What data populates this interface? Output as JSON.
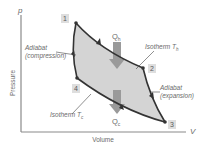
{
  "diagram": {
    "axes": {
      "y_symbol": "p",
      "y_label": "Pressure",
      "x_symbol": "V",
      "x_label": "Volume"
    },
    "points": [
      {
        "id": "1",
        "label": "1"
      },
      {
        "id": "2",
        "label": "2"
      },
      {
        "id": "3",
        "label": "3"
      },
      {
        "id": "4",
        "label": "4"
      }
    ],
    "heat": {
      "in": {
        "label": "Q",
        "sub": "h"
      },
      "out": {
        "label": "Q",
        "sub": "c"
      }
    },
    "annotations": {
      "adiabat_compression": {
        "line1": "Adiabat",
        "line2": "(compression)"
      },
      "adiabat_expansion": {
        "line1": "Adiabat",
        "line2": "(expansion)"
      },
      "isotherm_hot": {
        "text": "Isotherm T",
        "sub": "h"
      },
      "isotherm_cold": {
        "text": "Isotherm T",
        "sub": "c"
      }
    },
    "colors": {
      "fill": "#d4d4d4",
      "stroke": "#333333",
      "arrow": "#9a9a9a",
      "axis": "#8a8a8a",
      "badge_bg": "#dedede",
      "text": "#6b6b6b"
    }
  }
}
